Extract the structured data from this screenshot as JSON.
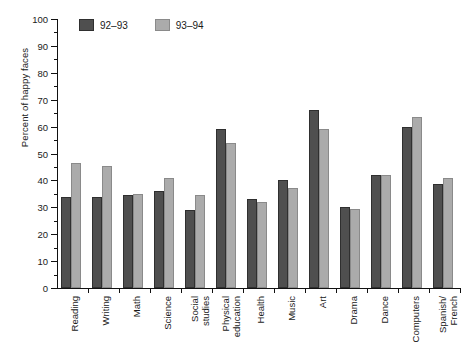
{
  "chart_data": {
    "type": "bar",
    "title": "",
    "xlabel": "",
    "ylabel": "Percent of happy faces",
    "ylim": [
      0,
      100
    ],
    "ytick_step": 10,
    "yticks": [
      0,
      10,
      20,
      30,
      40,
      50,
      60,
      70,
      80,
      90,
      100
    ],
    "minor_ytick_step": 5,
    "grid": false,
    "legend_position": "top-left-inside",
    "categories": [
      "Reading",
      "Writing",
      "Math",
      "Science",
      "Social\nstudies",
      "Physical\neducation",
      "Health",
      "Music",
      "Art",
      "Drama",
      "Dance",
      "Computers",
      "Spanish/\nFrench"
    ],
    "series": [
      {
        "name": "92–93",
        "color": "#4f4f4f",
        "values": [
          34,
          34,
          34.5,
          36,
          29,
          59,
          33,
          40,
          66,
          30,
          42,
          60,
          38.5
        ]
      },
      {
        "name": "93–94",
        "color": "#ababab",
        "values": [
          46.5,
          45.5,
          35,
          41,
          34.5,
          54,
          32,
          37,
          59,
          29.5,
          42,
          63.5,
          41
        ]
      }
    ]
  }
}
